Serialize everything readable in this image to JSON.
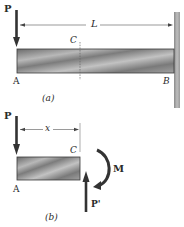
{
  "figure": {
    "panel_a": {
      "caption": "(a)",
      "load_label": "P",
      "length_label": "L",
      "section_label": "C",
      "left_end_label": "A",
      "right_end_label": "B"
    },
    "panel_b": {
      "caption": "(b)",
      "load_label": "P",
      "distance_label": "x",
      "section_label": "C",
      "left_end_label": "A",
      "moment_label": "M",
      "reaction_label": "P'"
    },
    "colors": {
      "line": "#3a3a3a",
      "beam_dark": "#6e6e6e",
      "beam_light": "#c4c4c4",
      "wall": "#a8a8a8"
    }
  }
}
